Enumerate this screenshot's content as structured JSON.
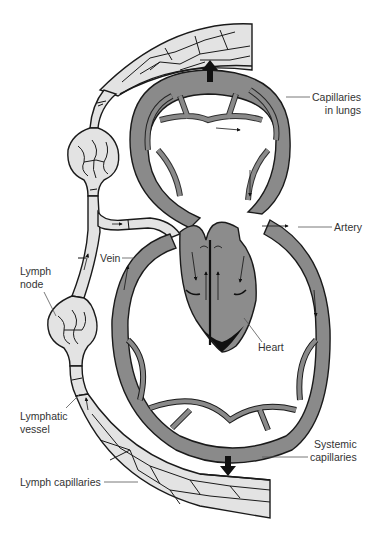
{
  "figure": {
    "colors": {
      "background": "#ffffff",
      "blood_vessel_fill": "#8a8a8a",
      "heart_fill": "#8c8c8c",
      "lymph_fill": "#e3e3e3",
      "outline": "#1a1a1a",
      "arrow": "#111111",
      "label_text": "#333333",
      "leader_line": "#555555"
    }
  },
  "labels": {
    "capillaries_in_lungs": {
      "line1": "Capillaries",
      "line2": "in lungs"
    },
    "artery": "Artery",
    "vein": "Vein",
    "lymph_node": {
      "line1": "Lymph",
      "line2": "node"
    },
    "heart": "Heart",
    "lymphatic_vessel": {
      "line1": "Lymphatic",
      "line2": "vessel"
    },
    "systemic_capillaries": {
      "line1": "Systemic",
      "line2": "capillaries"
    },
    "lymph_capillaries": "Lymph capillaries"
  },
  "icons": {
    "flow_arrow_up": "arrow-up-icon",
    "flow_arrow_down": "arrow-down-icon",
    "valve": "valve-icon"
  }
}
